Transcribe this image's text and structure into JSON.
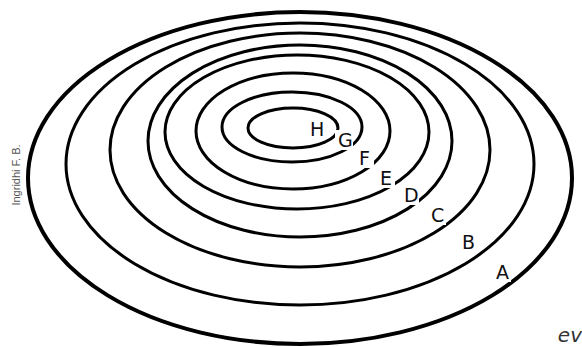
{
  "diagram": {
    "stroke_color": "#000000",
    "background": "#ffffff",
    "rings": [
      {
        "label": "A",
        "cx": 300,
        "cy": 178,
        "rx": 272,
        "ry": 166,
        "stroke": 4,
        "label_x": 496,
        "label_y": 279
      },
      {
        "label": "B",
        "cx": 300,
        "cy": 164,
        "rx": 234,
        "ry": 141,
        "stroke": 3,
        "label_x": 462,
        "label_y": 249
      },
      {
        "label": "C",
        "cx": 300,
        "cy": 150,
        "rx": 190,
        "ry": 117,
        "stroke": 3,
        "label_x": 431,
        "label_y": 222
      },
      {
        "label": "D",
        "cx": 300,
        "cy": 141,
        "rx": 152,
        "ry": 96,
        "stroke": 3,
        "label_x": 404,
        "label_y": 202
      },
      {
        "label": "E",
        "cx": 297,
        "cy": 132,
        "rx": 132,
        "ry": 77,
        "stroke": 3,
        "label_x": 380,
        "label_y": 185
      },
      {
        "label": "F",
        "cx": 293,
        "cy": 131,
        "rx": 97,
        "ry": 58,
        "stroke": 3,
        "label_x": 359,
        "label_y": 165
      },
      {
        "label": "G",
        "cx": 292,
        "cy": 127,
        "rx": 70,
        "ry": 35,
        "stroke": 3,
        "label_x": 338,
        "label_y": 147
      },
      {
        "label": "H",
        "cx": 293,
        "cy": 128,
        "rx": 45,
        "ry": 20,
        "stroke": 3,
        "label_x": 310,
        "label_y": 136
      }
    ]
  },
  "credit": "Ingridhi F. B.",
  "watermark": "ev"
}
